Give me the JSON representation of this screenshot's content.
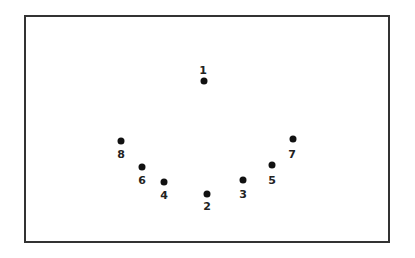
{
  "diagram": {
    "type": "numbered-point-arrangement",
    "colors": {
      "border": "#333333",
      "dot": "#111111",
      "label": "#222222",
      "background": "#ffffff"
    },
    "points": [
      {
        "id": "1",
        "label": "1",
        "x": 204,
        "y": 81,
        "label_x": 203,
        "label_y": 70
      },
      {
        "id": "2",
        "label": "2",
        "x": 207,
        "y": 194,
        "label_x": 207,
        "label_y": 206
      },
      {
        "id": "3",
        "label": "3",
        "x": 243,
        "y": 180,
        "label_x": 243,
        "label_y": 194
      },
      {
        "id": "4",
        "label": "4",
        "x": 164,
        "y": 182,
        "label_x": 164,
        "label_y": 195
      },
      {
        "id": "5",
        "label": "5",
        "x": 272,
        "y": 165,
        "label_x": 272,
        "label_y": 180
      },
      {
        "id": "6",
        "label": "6",
        "x": 142,
        "y": 167,
        "label_x": 142,
        "label_y": 180
      },
      {
        "id": "7",
        "label": "7",
        "x": 293,
        "y": 139,
        "label_x": 292,
        "label_y": 154
      },
      {
        "id": "8",
        "label": "8",
        "x": 121,
        "y": 141,
        "label_x": 121,
        "label_y": 154
      }
    ]
  }
}
